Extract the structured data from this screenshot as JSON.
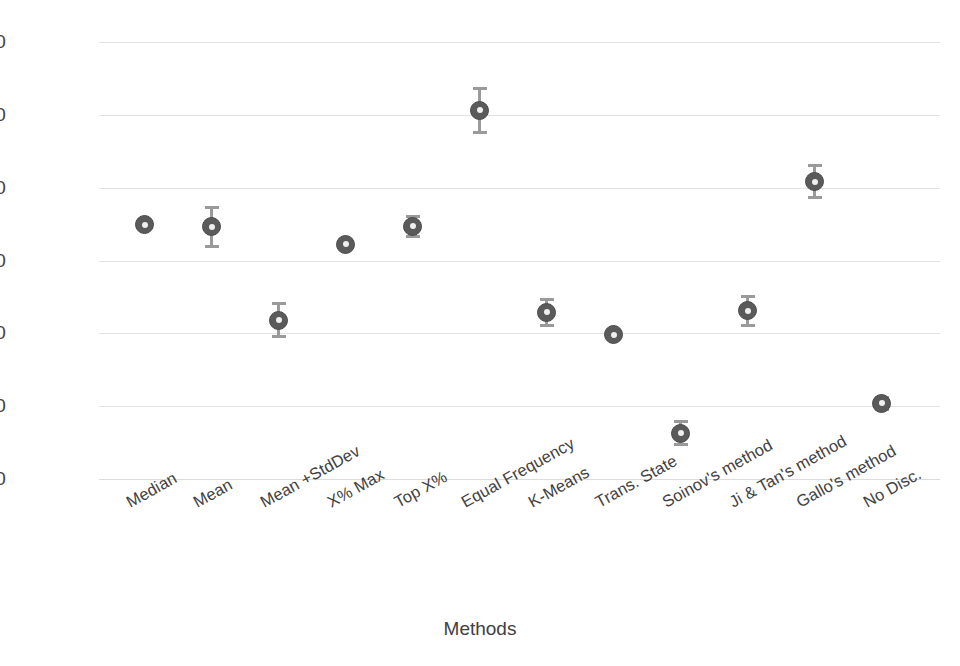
{
  "chart_data": {
    "type": "scatter",
    "title": "",
    "xlabel": "Methods",
    "ylabel": "Max Enrichment",
    "ylim": [
      0,
      60
    ],
    "yticks": [
      0,
      10,
      20,
      30,
      40,
      50,
      60
    ],
    "ytick_labels": [
      "0",
      "10",
      "20",
      "30",
      "40",
      "50",
      "60"
    ],
    "grid": true,
    "legend": "none",
    "marker_style": "ring-with-white-center",
    "series_name": "Max Enrichment",
    "categories": [
      "Median",
      "Mean",
      "Mean +StdDev",
      "X% Max",
      "Top X%",
      "Equal Frequency",
      "K-Means",
      "Trans. State",
      "Soinov's method",
      "Ji & Tan's method",
      "Gallo's method",
      "No Disc."
    ],
    "values": [
      34.9,
      34.6,
      21.8,
      32.2,
      34.7,
      50.6,
      22.9,
      19.8,
      6.3,
      23.1,
      40.8,
      10.4
    ],
    "errors": [
      0.0,
      2.7,
      2.3,
      0.0,
      1.4,
      3.0,
      1.8,
      0.0,
      1.6,
      2.0,
      2.2,
      0.8
    ],
    "points": [
      {
        "category": "Median",
        "value": 34.9,
        "error": 0.0
      },
      {
        "category": "Mean",
        "value": 34.6,
        "error": 2.7
      },
      {
        "category": "Mean +StdDev",
        "value": 21.8,
        "error": 2.3
      },
      {
        "category": "X% Max",
        "value": 32.2,
        "error": 0.0
      },
      {
        "category": "Top X%",
        "value": 34.7,
        "error": 1.4
      },
      {
        "category": "Equal Frequency",
        "value": 50.6,
        "error": 3.0
      },
      {
        "category": "K-Means",
        "value": 22.9,
        "error": 1.8
      },
      {
        "category": "Trans. State",
        "value": 19.8,
        "error": 0.0
      },
      {
        "category": "Soinov's method",
        "value": 6.3,
        "error": 1.6
      },
      {
        "category": "Ji & Tan's method",
        "value": 23.1,
        "error": 2.0
      },
      {
        "category": "Gallo's method",
        "value": 40.8,
        "error": 2.2
      },
      {
        "category": "No Disc.",
        "value": 10.4,
        "error": 0.8
      }
    ]
  },
  "colors": {
    "marker": "#5a5a5a",
    "marker_center": "#efefef",
    "errorbar": "#9a9a9a",
    "gridline": "#e2e2e2",
    "text": "#414141",
    "background": "#ffffff"
  }
}
